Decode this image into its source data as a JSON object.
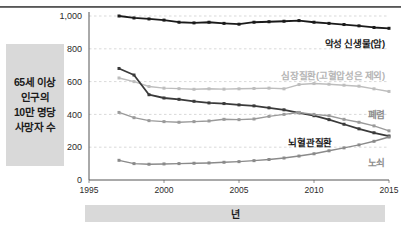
{
  "figure": {
    "y_axis_caption": [
      "65세 이상",
      "인구의",
      "10만 명당",
      "사망자 수"
    ],
    "x_axis_caption": "년"
  },
  "chart_data": {
    "type": "line",
    "title": "",
    "xlabel": "년",
    "ylabel": "65세 이상 인구의 10만 명당 사망자 수",
    "x": [
      1997,
      1998,
      1999,
      2000,
      2001,
      2002,
      2003,
      2004,
      2005,
      2006,
      2007,
      2008,
      2009,
      2010,
      2011,
      2012,
      2013,
      2014,
      2015
    ],
    "xlim": [
      1995,
      2015
    ],
    "ylim": [
      0,
      1000
    ],
    "xticks": [
      "1995",
      "2000",
      "2005",
      "2010",
      "2015"
    ],
    "yticks": [
      "0",
      "200",
      "400",
      "600",
      "800",
      "1,000"
    ],
    "grid": true,
    "legend_position": "inline-right",
    "series": [
      {
        "name": "악성 신생물(암)",
        "color": "#1a1a1a",
        "label_color": "#1a1a1a",
        "values": [
          1000,
          988,
          982,
          975,
          962,
          958,
          962,
          955,
          950,
          962,
          965,
          968,
          972,
          962,
          955,
          948,
          940,
          930,
          925
        ]
      },
      {
        "name": "심장질환(고혈압성은 제외)",
        "color": "#bdbdbd",
        "label_color": "#b5b5b5",
        "values": [
          622,
          600,
          570,
          560,
          557,
          553,
          556,
          554,
          556,
          558,
          560,
          556,
          582,
          588,
          584,
          578,
          572,
          556,
          540
        ]
      },
      {
        "name": "뇌혈관질환",
        "color": "#3a3a3a",
        "label_color": "#1a1a1a",
        "values": [
          680,
          640,
          520,
          500,
          492,
          480,
          470,
          466,
          458,
          452,
          440,
          428,
          410,
          392,
          368,
          340,
          312,
          288,
          268
        ]
      },
      {
        "name": "폐렴",
        "color": "#9a9a9a",
        "label_color": "#8d8d8d",
        "values": [
          412,
          380,
          362,
          356,
          352,
          356,
          360,
          370,
          368,
          372,
          388,
          400,
          412,
          400,
          392,
          370,
          352,
          330,
          300
        ]
      },
      {
        "name": "노쇠",
        "color": "#8a8a8a",
        "label_color": "#8d8d8d",
        "values": [
          120,
          100,
          96,
          98,
          100,
          102,
          104,
          108,
          112,
          118,
          125,
          134,
          146,
          160,
          178,
          196,
          214,
          236,
          262
        ]
      }
    ]
  }
}
